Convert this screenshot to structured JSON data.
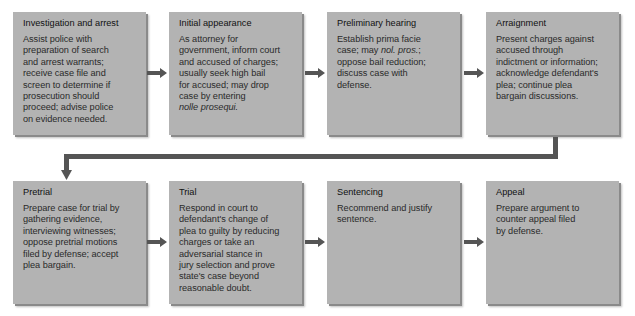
{
  "row1": [
    {
      "title": "Investigation and arrest",
      "lines": [
        "Assist police with",
        "preparation of search",
        "and arrest warrants;",
        "receive case file and",
        "screen to determine if",
        "prosecution should",
        "proceed; advise police",
        "on evidence needed."
      ]
    },
    {
      "title": "Initial appearance",
      "lines": [
        "As attorney for",
        "government, inform court",
        "and accused of charges;",
        "usually seek high bail",
        "for accused; may drop",
        "case by entering"
      ],
      "italic_line": "nolle prosequi."
    },
    {
      "title": "Preliminary hearing",
      "line1": "Establish prima facie",
      "line2_pre": "case; may ",
      "line2_italic": "nol. pros.",
      "line2_post": ";",
      "lines": [
        "oppose bail reduction;",
        "discuss case with",
        "defense."
      ]
    },
    {
      "title": "Arraignment",
      "lines": [
        "Present charges against",
        "accused through",
        "indictment or information;",
        "acknowledge defendant's",
        "plea; continue plea",
        "bargain discussions."
      ]
    }
  ],
  "row2": [
    {
      "title": "Pretrial",
      "lines": [
        "Prepare case for trial by",
        "gathering evidence,",
        "interviewing witnesses;",
        "oppose pretrial motions",
        "filed by defense; accept",
        "plea bargain."
      ]
    },
    {
      "title": "Trial",
      "lines": [
        "Respond in court to",
        "defendant's change of",
        "plea to guilty by reducing",
        "charges or take an",
        "adversarial stance in",
        "jury selection and prove",
        "state's case beyond",
        "reasonable doubt."
      ]
    },
    {
      "title": "Sentencing",
      "lines": [
        "Recommend and justify",
        "sentence."
      ]
    },
    {
      "title": "Appeal",
      "lines": [
        "Prepare argument to",
        "counter appeal filed",
        "by defense."
      ]
    }
  ],
  "colors": {
    "box": "#b3b3b3",
    "arrow": "#555555",
    "text": "#1e1e1e"
  }
}
